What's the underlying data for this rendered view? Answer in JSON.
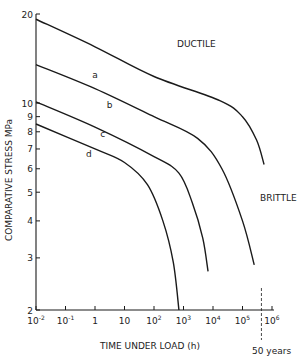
{
  "chart_data": {
    "type": "line",
    "title": "",
    "xlabel": "TIME UNDER LOAD (h)",
    "ylabel": "COMPARATIVE STRESS MPa",
    "xscale": "log",
    "yscale": "log",
    "xlim": [
      0.01,
      1000000
    ],
    "ylim": [
      2,
      20
    ],
    "grid": false,
    "x_ticks": [
      {
        "value": 0.01,
        "label_base": "10",
        "label_exp": "-2"
      },
      {
        "value": 0.1,
        "label_base": "10",
        "label_exp": "-1"
      },
      {
        "value": 1,
        "label_base": "1",
        "label_exp": ""
      },
      {
        "value": 10,
        "label_base": "10",
        "label_exp": ""
      },
      {
        "value": 100,
        "label_base": "10",
        "label_exp": "2"
      },
      {
        "value": 1000,
        "label_base": "10",
        "label_exp": "3"
      },
      {
        "value": 10000,
        "label_base": "10",
        "label_exp": "4"
      },
      {
        "value": 100000,
        "label_base": "10",
        "label_exp": "5"
      },
      {
        "value": 1000000,
        "label_base": "10",
        "label_exp": "6"
      }
    ],
    "y_ticks": [
      {
        "value": 2,
        "label": "2"
      },
      {
        "value": 3,
        "label": "3"
      },
      {
        "value": 4,
        "label": "4"
      },
      {
        "value": 5,
        "label": "5"
      },
      {
        "value": 6,
        "label": "6"
      },
      {
        "value": 7,
        "label": "7"
      },
      {
        "value": 8,
        "label": "8"
      },
      {
        "value": 9,
        "label": "9"
      },
      {
        "value": 10,
        "label": "10"
      },
      {
        "value": 20,
        "label": "20"
      }
    ],
    "series": [
      {
        "name": "a",
        "label_pos": [
          0.8,
          12.2
        ],
        "points": [
          [
            0.01,
            19.2
          ],
          [
            1,
            15.5
          ],
          [
            100,
            12.3
          ],
          [
            17000,
            10.2
          ],
          [
            100000,
            9.0
          ],
          [
            300000,
            7.5
          ],
          [
            540000,
            6.2
          ]
        ]
      },
      {
        "name": "b",
        "label_pos": [
          2.5,
          9.6
        ],
        "points": [
          [
            0.01,
            13.5
          ],
          [
            1,
            11.2
          ],
          [
            100,
            9.0
          ],
          [
            3000,
            7.6
          ],
          [
            20000,
            6.0
          ],
          [
            100000,
            4.0
          ],
          [
            250000,
            2.84
          ]
        ]
      },
      {
        "name": "c",
        "label_pos": [
          1.5,
          7.7
        ],
        "points": [
          [
            0.01,
            10.1
          ],
          [
            1,
            8.3
          ],
          [
            100,
            6.6
          ],
          [
            700,
            5.8
          ],
          [
            2000,
            4.6
          ],
          [
            4500,
            3.5
          ],
          [
            6800,
            2.7
          ]
        ]
      },
      {
        "name": "d",
        "label_pos": [
          0.5,
          6.6
        ],
        "points": [
          [
            0.01,
            8.5
          ],
          [
            1,
            7.0
          ],
          [
            10,
            6.3
          ],
          [
            60,
            5.3
          ],
          [
            200,
            4.0
          ],
          [
            450,
            2.9
          ],
          [
            700,
            2.0
          ]
        ]
      }
    ],
    "annotations": [
      {
        "text": "DUCTILE",
        "x": 200,
        "y": 19
      },
      {
        "text": "BRITTLE",
        "x": 1500000,
        "y": 4.6
      },
      {
        "text": "50 years",
        "x": 438000,
        "y": 1.75,
        "type": "vertical-dashed-line"
      }
    ],
    "legend": "none (curves labelled a, b, c, d inline)"
  },
  "labels": {
    "ductile": "DUCTILE",
    "brittle": "BRITTLE",
    "fifty_years": "50 years",
    "xlabel": "TIME UNDER LOAD (h)",
    "ylabel": "COMPARATIVE STRESS MPa"
  },
  "colors": {
    "line": "#1a1a1a",
    "text": "#222222",
    "background": "#ffffff"
  }
}
